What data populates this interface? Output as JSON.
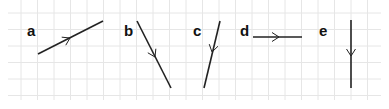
{
  "diagram": {
    "type": "vector-direction-grid",
    "grid": {
      "color": "#e6e6e6",
      "spacing": 16.5,
      "x0": 21,
      "y0": 13,
      "cols": 22,
      "rows": 6
    },
    "line_color": "#222222",
    "vectors": [
      {
        "label": "a",
        "label_x": 27,
        "label_y": 36,
        "x1": 38,
        "y1": 54,
        "x2": 103,
        "y2": 21,
        "arrow_at": [
          70,
          38
        ],
        "direction": "up-right"
      },
      {
        "label": "b",
        "label_x": 124,
        "label_y": 36,
        "x1": 137,
        "y1": 21,
        "x2": 171,
        "y2": 88,
        "arrow_at": [
          155,
          57
        ],
        "direction": "down-right"
      },
      {
        "label": "c",
        "label_x": 193,
        "label_y": 36,
        "x1": 220,
        "y1": 21,
        "x2": 204,
        "y2": 88,
        "arrow_at": [
          212,
          52
        ],
        "direction": "down-left"
      },
      {
        "label": "d",
        "label_x": 240,
        "label_y": 36,
        "x1": 253,
        "y1": 37,
        "x2": 302,
        "y2": 37,
        "arrow_at": [
          279,
          37
        ],
        "direction": "right"
      },
      {
        "label": "e",
        "label_x": 319,
        "label_y": 36,
        "x1": 351,
        "y1": 20,
        "x2": 351,
        "y2": 88,
        "arrow_at": [
          351,
          56
        ],
        "direction": "down"
      }
    ]
  }
}
